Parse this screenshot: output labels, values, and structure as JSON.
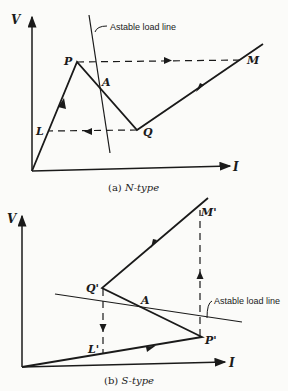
{
  "figure_a": {
    "caption_prefix": "(a) ",
    "caption_type": "N-type",
    "axis_v": "V",
    "axis_i": "I",
    "points": {
      "P": "P",
      "A": "A",
      "Q": "Q",
      "L": "L",
      "M": "M"
    },
    "load_line_label": "Astable load line"
  },
  "figure_b": {
    "caption_prefix": "(b) ",
    "caption_type": "S-type",
    "axis_v": "V",
    "axis_i": "I",
    "points": {
      "Q": "Q'",
      "A": "A",
      "P": "P'",
      "L": "L'",
      "M": "M'"
    },
    "load_line_label": "Astable load line"
  },
  "colors": {
    "ink": "#1a1a1a",
    "paper": "#fbfbf9"
  }
}
